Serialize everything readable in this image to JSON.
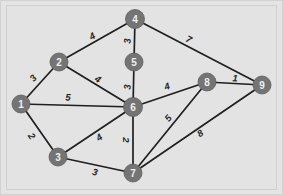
{
  "figure": {
    "kind": "weighted-undirected-graph",
    "background_color": "#e6e6e6",
    "panel_color": "#e3e3e3",
    "node_color": "#747474",
    "node_label_color": "#efefef",
    "edge_color": "#1f1f1f",
    "weight_label_color": "#262626",
    "width": 283,
    "height": 195
  },
  "chart_data": {
    "type": "diagram",
    "title": "",
    "nodes": [
      {
        "id": "1",
        "label": "1",
        "x": 21,
        "y": 104,
        "r": 9
      },
      {
        "id": "2",
        "label": "2",
        "x": 59,
        "y": 62,
        "r": 9
      },
      {
        "id": "3",
        "label": "3",
        "x": 58,
        "y": 157,
        "r": 9
      },
      {
        "id": "4",
        "label": "4",
        "x": 135,
        "y": 19,
        "r": 9.5
      },
      {
        "id": "5",
        "label": "5",
        "x": 134,
        "y": 62,
        "r": 9
      },
      {
        "id": "6",
        "label": "6",
        "x": 133,
        "y": 107,
        "r": 9.5
      },
      {
        "id": "7",
        "label": "7",
        "x": 133,
        "y": 173,
        "r": 9
      },
      {
        "id": "8",
        "label": "8",
        "x": 207,
        "y": 82,
        "r": 9
      },
      {
        "id": "9",
        "label": "9",
        "x": 262,
        "y": 85,
        "r": 9
      }
    ],
    "edges": [
      {
        "source": "1",
        "target": "2",
        "weight": "3",
        "lx": 33,
        "ly": 78
      },
      {
        "source": "1",
        "target": "6",
        "weight": "5",
        "lx": 68,
        "ly": 97
      },
      {
        "source": "1",
        "target": "3",
        "weight": "2",
        "lx": 32,
        "ly": 136
      },
      {
        "source": "2",
        "target": "4",
        "weight": "4",
        "lx": 92,
        "ly": 36
      },
      {
        "source": "2",
        "target": "6",
        "weight": "4",
        "lx": 98,
        "ly": 79
      },
      {
        "source": "4",
        "target": "5",
        "weight": "3",
        "lx": 127,
        "ly": 41
      },
      {
        "source": "4",
        "target": "9",
        "weight": "7",
        "lx": 189,
        "ly": 39
      },
      {
        "source": "5",
        "target": "6",
        "weight": "3",
        "lx": 127,
        "ly": 87
      },
      {
        "source": "3",
        "target": "6",
        "weight": "4",
        "lx": 99,
        "ly": 137
      },
      {
        "source": "3",
        "target": "7",
        "weight": "3",
        "lx": 95,
        "ly": 172
      },
      {
        "source": "6",
        "target": "7",
        "weight": "2",
        "lx": 126,
        "ly": 140
      },
      {
        "source": "6",
        "target": "8",
        "weight": "4",
        "lx": 167,
        "ly": 86
      },
      {
        "source": "7",
        "target": "8",
        "weight": "5",
        "lx": 168,
        "ly": 118
      },
      {
        "source": "7",
        "target": "9",
        "weight": "8",
        "lx": 200,
        "ly": 133
      },
      {
        "source": "8",
        "target": "9",
        "weight": "1",
        "lx": 235,
        "ly": 78
      }
    ]
  }
}
